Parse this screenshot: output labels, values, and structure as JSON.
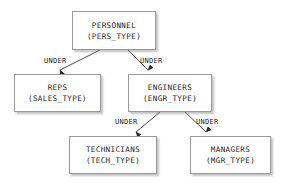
{
  "diagram": {
    "background_color": "#ffffff",
    "box_border_color": "#9a9a9a",
    "text_color": "#1c1c1c",
    "arrow_color": "#4a4a4a",
    "nodes": [
      {
        "id": "personnel",
        "name": "PERSONNEL",
        "type": "(PERS_TYPE)",
        "x": 72,
        "y": 11,
        "w": 84,
        "h": 39
      },
      {
        "id": "reps",
        "name": "REPS",
        "type": "(SALES_TYPE)",
        "x": 14,
        "y": 74,
        "w": 87,
        "h": 38
      },
      {
        "id": "engineers",
        "name": "ENGINEERS",
        "type": "(ENGR_TYPE)",
        "x": 128,
        "y": 74,
        "w": 84,
        "h": 38
      },
      {
        "id": "technicians",
        "name": "TECHNICIANS",
        "type": "(TECH_TYPE)",
        "x": 69,
        "y": 136,
        "w": 88,
        "h": 38
      },
      {
        "id": "managers",
        "name": "MANAGERS",
        "type": "(MGR_TYPE)",
        "x": 190,
        "y": 136,
        "w": 81,
        "h": 38
      }
    ],
    "edges": [
      {
        "id": "personnel-reps",
        "from": "personnel",
        "to": "reps",
        "label": "UNDER",
        "label_x": 44,
        "label_y": 57,
        "x1": 100,
        "y1": 50,
        "x2": 60,
        "y2": 70
      },
      {
        "id": "personnel-engineers",
        "from": "personnel",
        "to": "engineers",
        "label": "UNDER",
        "label_x": 140,
        "label_y": 57,
        "x1": 128,
        "y1": 50,
        "x2": 148,
        "y2": 70
      },
      {
        "id": "engineers-technicians",
        "from": "engineers",
        "to": "technicians",
        "label": "UNDER",
        "label_x": 115,
        "label_y": 118,
        "x1": 160,
        "y1": 112,
        "x2": 136,
        "y2": 132
      },
      {
        "id": "engineers-managers",
        "from": "engineers",
        "to": "managers",
        "label": "UNDER",
        "label_x": 196,
        "label_y": 118,
        "x1": 185,
        "y1": 112,
        "x2": 206,
        "y2": 132
      }
    ]
  }
}
